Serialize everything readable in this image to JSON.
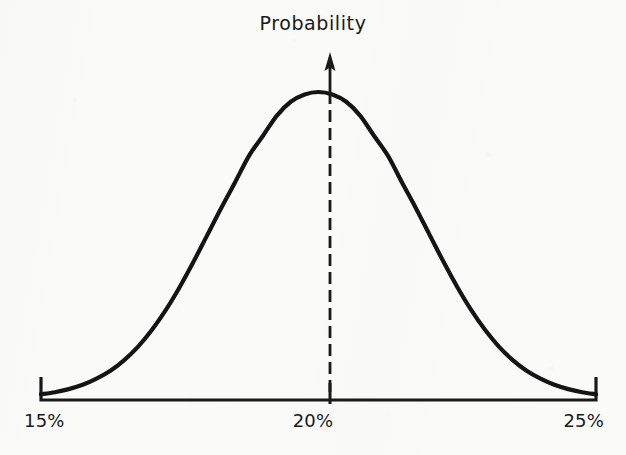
{
  "figure": {
    "title": "Probability",
    "background_color": "#fbfbfa",
    "ink_color": "#191919"
  },
  "axis": {
    "tick_labels": [
      "15%",
      "20%",
      "25%"
    ],
    "left_label": "15%",
    "center_label": "20%",
    "right_label": "25%"
  },
  "annotations": {
    "center_marker": "dashed vertical line at 20%",
    "arrow": "upward arrow at peak"
  },
  "chart_data": {
    "type": "line",
    "title": "Probability",
    "xlabel": "",
    "ylabel": "Probability",
    "xlim": [
      15,
      25
    ],
    "ylim": [
      0,
      1
    ],
    "grid": false,
    "legend": null,
    "tick_labels": [
      "15%",
      "20%",
      "25%"
    ],
    "ticks": [
      15,
      20,
      25
    ],
    "mean": 20,
    "sigma": 1.65,
    "peak_x": 20,
    "peak_y": 1.0,
    "annotations": [
      {
        "kind": "vline",
        "style": "dashed",
        "x": 20,
        "from_y": 0,
        "to_y": 1.0
      },
      {
        "kind": "arrow",
        "direction": "up",
        "x": 20,
        "from_y": 1.0,
        "to_y": 1.12
      }
    ],
    "x": [
      15.0,
      15.25,
      15.5,
      15.75,
      16.0,
      16.25,
      16.5,
      16.75,
      17.0,
      17.25,
      17.5,
      17.75,
      18.0,
      18.25,
      18.5,
      18.75,
      19.0,
      19.25,
      19.5,
      19.75,
      20.0,
      20.25,
      20.5,
      20.75,
      21.0,
      21.25,
      21.5,
      21.75,
      22.0,
      22.25,
      22.5,
      22.75,
      23.0,
      23.25,
      23.5,
      23.75,
      24.0,
      24.25,
      24.5,
      24.75,
      25.0
    ],
    "y": [
      0.012,
      0.019,
      0.029,
      0.043,
      0.063,
      0.089,
      0.124,
      0.168,
      0.223,
      0.288,
      0.363,
      0.446,
      0.534,
      0.622,
      0.706,
      0.792,
      0.857,
      0.923,
      0.968,
      0.992,
      1.0,
      0.992,
      0.968,
      0.923,
      0.857,
      0.792,
      0.706,
      0.622,
      0.534,
      0.446,
      0.363,
      0.288,
      0.223,
      0.168,
      0.124,
      0.089,
      0.063,
      0.043,
      0.029,
      0.019,
      0.012
    ]
  }
}
